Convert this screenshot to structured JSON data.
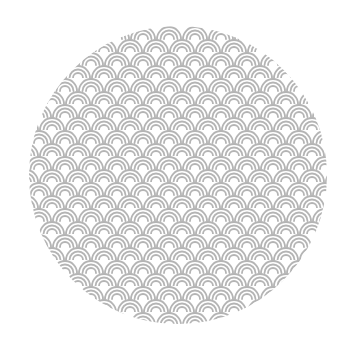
{
  "image": {
    "subject": "circular seigaiha wave pattern",
    "shape": "circle",
    "background_color": "#ffffff",
    "pattern": {
      "name": "seigaiha",
      "stroke_color": "#b4b4b4",
      "cell_width": 26,
      "row_height": 13,
      "arcs_per_scale": 3
    },
    "circle": {
      "cx": 178,
      "cy": 175,
      "r": 149
    }
  }
}
